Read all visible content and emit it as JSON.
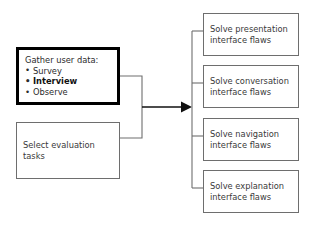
{
  "diagram": {
    "type": "flowchart",
    "title": "",
    "background_color": "#ffffff",
    "source_nodes": [
      {
        "id": "gather-user-data",
        "emphasis": "thick-border",
        "border_color": "#000000",
        "title": "Gather user data:",
        "items": [
          {
            "label": "Survey",
            "bold": false
          },
          {
            "label": "Interview",
            "bold": true
          },
          {
            "label": "Observe",
            "bold": false
          }
        ]
      },
      {
        "id": "select-evaluation-tasks",
        "emphasis": "thin-border",
        "border_color": "#6e6e6e",
        "line1": "Select evaluation",
        "line2": "tasks"
      }
    ],
    "target_nodes": [
      {
        "id": "solve-presentation",
        "line1": "Solve presentation",
        "line2": "interface flaws"
      },
      {
        "id": "solve-conversation",
        "line1": "Solve conversation",
        "line2": "interface flaws"
      },
      {
        "id": "solve-navigation",
        "line1": "Solve navigation",
        "line2": "interface flaws"
      },
      {
        "id": "solve-explanation",
        "line1": "Solve explanation",
        "line2": "interface flaws"
      }
    ],
    "connector": {
      "arrow_direction": "right",
      "arrow_color": "#111111",
      "line_color": "#6e6e6e",
      "merge_label": "",
      "fan_out_count": 4
    }
  }
}
